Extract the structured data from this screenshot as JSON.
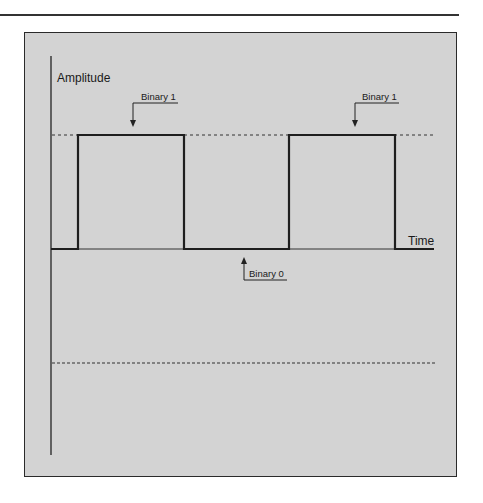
{
  "colors": {
    "panel_background": "#d3d3d3",
    "line": "#1e1e1e",
    "page_background": "#ffffff"
  },
  "diagram": {
    "title": "",
    "y_axis_label": "Amplitude",
    "x_axis_label": "Time",
    "annotations": [
      {
        "id": "binary-1-first",
        "label": "Binary 1",
        "points_to": "first high pulse"
      },
      {
        "id": "binary-1-second",
        "label": "Binary 1",
        "points_to": "second high pulse"
      },
      {
        "id": "binary-0",
        "label": "Binary 0",
        "points_to": "low level between pulses"
      }
    ],
    "signal": {
      "type": "square-wave",
      "bits": [
        0,
        1,
        0,
        1,
        0
      ],
      "levels": {
        "high": "dashed reference line",
        "low": "time axis",
        "negative_reference": "lower dashed line"
      }
    }
  }
}
